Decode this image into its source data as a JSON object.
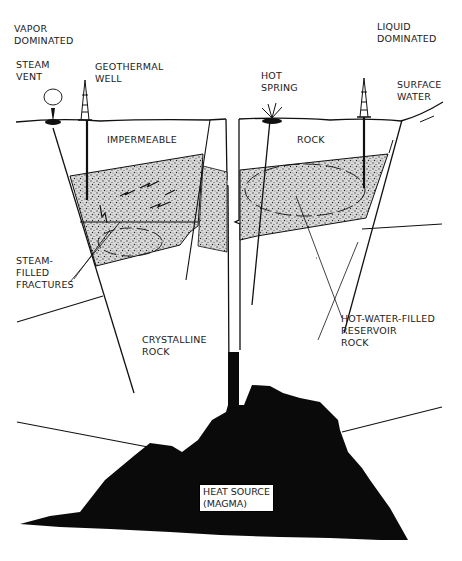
{
  "diagram": {
    "type": "geothermal-system-cross-section",
    "colors": {
      "ink": "#111111",
      "background": "#ffffff",
      "reservoir_fill": "#bdbdbd",
      "magma": "#0a0a0a"
    }
  },
  "headings": {
    "left": "VAPOR\nDOMINATED",
    "right": "LIQUID\nDOMINATED"
  },
  "surface_features": {
    "steam_vent": "STEAM\nVENT",
    "geothermal_well": "GEOTHERMAL\nWELL",
    "hot_spring": "HOT\nSPRING",
    "surface_water": "SURFACE\nWATER"
  },
  "layers": {
    "impermeable": "IMPERMEABLE",
    "rock": "ROCK",
    "crystalline_rock": "CRYSTALLINE\nROCK"
  },
  "callouts": {
    "steam_filled_fractures": "STEAM-\nFILLED\nFRACTURES",
    "hot_water_reservoir": "HOT-WATER-FILLED\nRESERVOIR\nROCK"
  },
  "heat_source": {
    "label": "HEAT SOURCE\n(MAGMA)"
  }
}
